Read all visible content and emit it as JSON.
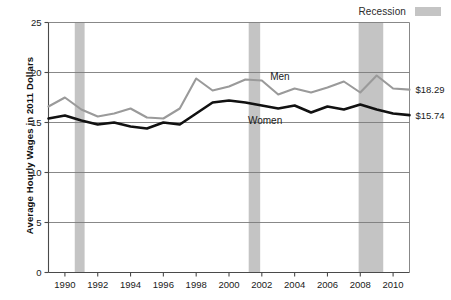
{
  "legend": {
    "recession_label": "Recession",
    "recession_color": "#c4c4c4"
  },
  "axis": {
    "ytitle": "Average Hourly Wages in 2011 Dollars",
    "yticks": [
      "0",
      "5",
      "10",
      "15",
      "20",
      "25"
    ],
    "xticks": [
      "1990",
      "1992",
      "1994",
      "1996",
      "1998",
      "2000",
      "2002",
      "2004",
      "2006",
      "2008",
      "2010"
    ]
  },
  "annotations": {
    "men_label": "Men",
    "women_label": "Women",
    "men_end_value": "$18.29",
    "women_end_value": "$15.74"
  },
  "chart_data": {
    "type": "line",
    "title": "",
    "xlabel": "",
    "ylabel": "Average Hourly Wages in 2011 Dollars",
    "xlim": [
      1989,
      2011
    ],
    "ylim": [
      0,
      25
    ],
    "ytick_values": [
      0,
      5,
      10,
      15,
      20,
      25
    ],
    "xtick_values": [
      1990,
      1992,
      1994,
      1996,
      1998,
      2000,
      2002,
      2004,
      2006,
      2008,
      2010
    ],
    "grid": "horizontal",
    "legend_position": "top-right",
    "x": [
      1989,
      1990,
      1991,
      1992,
      1993,
      1994,
      1995,
      1996,
      1997,
      1998,
      1999,
      2000,
      2001,
      2002,
      2003,
      2004,
      2005,
      2006,
      2007,
      2008,
      2009,
      2010,
      2011
    ],
    "series": [
      {
        "name": "Men",
        "color": "#9a9a9a",
        "end_label": "$18.29",
        "values": [
          16.6,
          17.5,
          16.3,
          15.6,
          15.9,
          16.4,
          15.5,
          15.4,
          16.4,
          19.4,
          18.2,
          18.6,
          19.3,
          19.2,
          17.8,
          18.4,
          18.0,
          18.5,
          19.1,
          18.0,
          19.7,
          18.4,
          18.29
        ]
      },
      {
        "name": "Women",
        "color": "#111111",
        "end_label": "$15.74",
        "values": [
          15.4,
          15.7,
          15.2,
          14.8,
          15.0,
          14.6,
          14.4,
          15.0,
          14.8,
          15.9,
          17.0,
          17.2,
          17.0,
          16.7,
          16.4,
          16.7,
          16.0,
          16.6,
          16.3,
          16.8,
          16.3,
          15.9,
          15.74
        ]
      }
    ],
    "recession_bands": [
      {
        "start": 1990.6,
        "end": 1991.2
      },
      {
        "start": 2001.2,
        "end": 2001.9
      },
      {
        "start": 2007.9,
        "end": 2009.4
      }
    ]
  }
}
